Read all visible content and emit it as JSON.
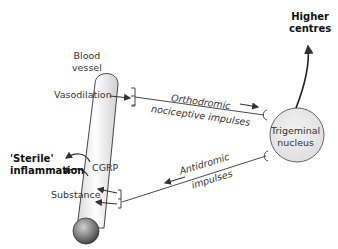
{
  "labels": {
    "blood_vessel": [
      "Blood",
      "vessel"
    ],
    "vasodilation": "Vasodilation",
    "higher_centres": [
      "Higher",
      "centres"
    ],
    "orthodromic": [
      "Orthodromic",
      "nociceptive impulses"
    ],
    "trigeminal": [
      "Trigeminal",
      "nucleus"
    ],
    "antidromic": [
      "Antidromic",
      "impulses"
    ],
    "sterile": [
      "'Sterile'",
      "inflammation"
    ],
    "cgrp": "CGRP",
    "substance": "Substance"
  },
  "colors": {
    "line": "#333333",
    "nucleus_fill": "#e6e6e6",
    "vessel_fill": "#f2f2f2"
  }
}
